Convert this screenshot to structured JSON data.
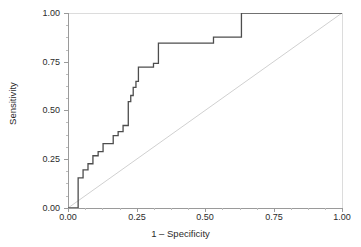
{
  "chart_data": {
    "type": "line",
    "title": "",
    "xlabel": "1 – Specificity",
    "ylabel": "Sensitivity",
    "xlim": [
      0.0,
      1.0
    ],
    "ylim": [
      0.0,
      1.0
    ],
    "grid": false,
    "legend": "none",
    "xticks": [
      "0.00",
      "0.25",
      "0.50",
      "0.75",
      "1.00"
    ],
    "xtickvalues": [
      0.0,
      0.25,
      0.5,
      0.75,
      1.0
    ],
    "yticks": [
      "0.00",
      "0.25",
      "0.50",
      "0.75",
      "1.00"
    ],
    "ytickvalues": [
      0.0,
      0.25,
      0.5,
      0.75,
      1.0
    ],
    "series": [
      {
        "name": "ROC curve",
        "color": "#4d4d4d",
        "style": "step",
        "x": [
          0.0,
          0.037,
          0.037,
          0.055,
          0.055,
          0.073,
          0.073,
          0.091,
          0.091,
          0.11,
          0.11,
          0.128,
          0.128,
          0.165,
          0.165,
          0.183,
          0.183,
          0.201,
          0.201,
          0.22,
          0.22,
          0.22,
          0.22,
          0.229,
          0.229,
          0.238,
          0.238,
          0.248,
          0.248,
          0.257,
          0.257,
          0.312,
          0.312,
          0.33,
          0.33,
          0.531,
          0.531,
          0.633,
          0.633,
          1.0
        ],
        "y": [
          0.0,
          0.0,
          0.155,
          0.155,
          0.196,
          0.196,
          0.227,
          0.227,
          0.268,
          0.268,
          0.289,
          0.289,
          0.33,
          0.33,
          0.371,
          0.371,
          0.392,
          0.392,
          0.423,
          0.423,
          0.505,
          0.515,
          0.546,
          0.546,
          0.577,
          0.577,
          0.619,
          0.619,
          0.649,
          0.649,
          0.722,
          0.722,
          0.742,
          0.742,
          0.845,
          0.845,
          0.876,
          0.876,
          1.0,
          1.0
        ]
      },
      {
        "name": "Reference diagonal",
        "color": "#d0d0d0",
        "style": "line",
        "x": [
          0.0,
          1.0
        ],
        "y": [
          0.0,
          1.0
        ]
      }
    ]
  },
  "axes": {
    "x_title": "1 – Specificity",
    "y_title": "Sensitivity",
    "x_labels": [
      "0.00",
      "0.25",
      "0.50",
      "0.75",
      "1.00"
    ],
    "y_labels": [
      "0.00",
      "0.25",
      "0.50",
      "0.75",
      "1.00"
    ]
  },
  "colors": {
    "curve": "#4d4d4d",
    "reference": "#d0d0d0",
    "axis": "#9a9a9a",
    "text": "#2b2b2b",
    "background": "#ffffff"
  }
}
